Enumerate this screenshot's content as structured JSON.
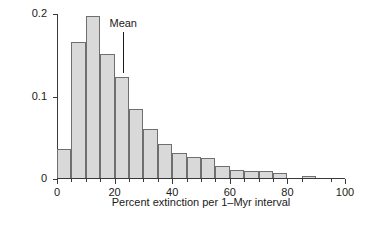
{
  "chart_data": {
    "type": "bar",
    "title": "",
    "subtitle": "",
    "xlabel": "Percent extinction per 1–Myr interval",
    "ylabel": "Frequency",
    "xlim": [
      0,
      100
    ],
    "ylim": [
      0,
      0.2
    ],
    "grid": false,
    "legend": null,
    "bin_width": 5,
    "x_major_ticks": [
      0,
      20,
      40,
      60,
      80,
      100
    ],
    "x_major_tick_labels": [
      "0",
      "20",
      "40",
      "60",
      "80",
      "100"
    ],
    "x_minor_ticks": [
      5,
      10,
      15,
      25,
      30,
      35,
      45,
      50,
      55,
      65,
      70,
      75,
      85,
      95
    ],
    "y_ticks": [
      0,
      0.1,
      0.2
    ],
    "y_tick_labels": [
      "0",
      "0.1",
      "0.2"
    ],
    "bin_starts": [
      0,
      5,
      10,
      15,
      20,
      25,
      30,
      35,
      40,
      45,
      50,
      55,
      60,
      65,
      70,
      75,
      85
    ],
    "bin_centers": [
      2.5,
      7.5,
      12.5,
      17.5,
      22.5,
      27.5,
      32.5,
      37.5,
      42.5,
      47.5,
      52.5,
      57.5,
      62.5,
      67.5,
      72.5,
      77.5,
      87.5
    ],
    "values": [
      0.035,
      0.165,
      0.196,
      0.15,
      0.122,
      0.084,
      0.06,
      0.041,
      0.03,
      0.026,
      0.024,
      0.014,
      0.01,
      0.009,
      0.009,
      0.006,
      0.003
    ],
    "annotations": [
      {
        "label": "Mean",
        "x": 23,
        "line_top_value": 0.178,
        "line_bottom_value": 0.128
      }
    ],
    "colors": {
      "bar_fill": "#d9d9d9",
      "bar_edge": "#6f6f6f",
      "axis": "#3a3a3a",
      "text": "#1a1a1a",
      "background": "#ffffff"
    }
  }
}
